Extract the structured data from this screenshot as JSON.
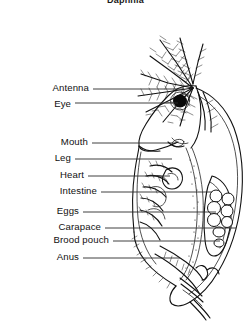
{
  "figure": {
    "title": "Daphnia",
    "organism": "Daphnia",
    "background_color": "#ffffff",
    "ink_color": "#111111",
    "leader_color": "#2a2a2a"
  },
  "labels": [
    {
      "id": "antenna",
      "text": "Antenna",
      "y": 89,
      "line_x1": 93,
      "line_x2": 184,
      "line_y": 89
    },
    {
      "id": "eye",
      "text": "Eye",
      "y": 105,
      "line_x1": 75,
      "line_x2": 178,
      "line_y": 103
    },
    {
      "id": "mouth",
      "text": "Mouth",
      "y": 143,
      "line_x1": 92,
      "line_x2": 176,
      "line_y": 143
    },
    {
      "id": "leg",
      "text": "Leg",
      "y": 159,
      "line_x1": 75,
      "line_x2": 172,
      "line_y": 159
    },
    {
      "id": "heart",
      "text": "Heart",
      "y": 176,
      "line_x1": 88,
      "line_x2": 170,
      "line_y": 176
    },
    {
      "id": "intestine",
      "text": "Intestine",
      "y": 192,
      "line_x1": 101,
      "line_x2": 212,
      "line_y": 192
    },
    {
      "id": "eggs",
      "text": "Eggs",
      "y": 212,
      "line_x1": 83,
      "line_x2": 216,
      "line_y": 212
    },
    {
      "id": "carapace",
      "text": "Carapace",
      "y": 228,
      "line_x1": 105,
      "line_x2": 236,
      "line_y": 228
    },
    {
      "id": "brood-pouch",
      "text": "Brood pouch",
      "y": 241,
      "line_x1": 113,
      "line_x2": 220,
      "line_y": 241
    },
    {
      "id": "anus",
      "text": "Anus",
      "y": 258,
      "line_x1": 83,
      "line_x2": 180,
      "line_y": 258
    }
  ],
  "anatomy_parts": [
    "antenna",
    "eye",
    "mouth",
    "leg",
    "heart",
    "intestine",
    "eggs",
    "carapace",
    "brood pouch",
    "anus"
  ],
  "egg_count": 8
}
